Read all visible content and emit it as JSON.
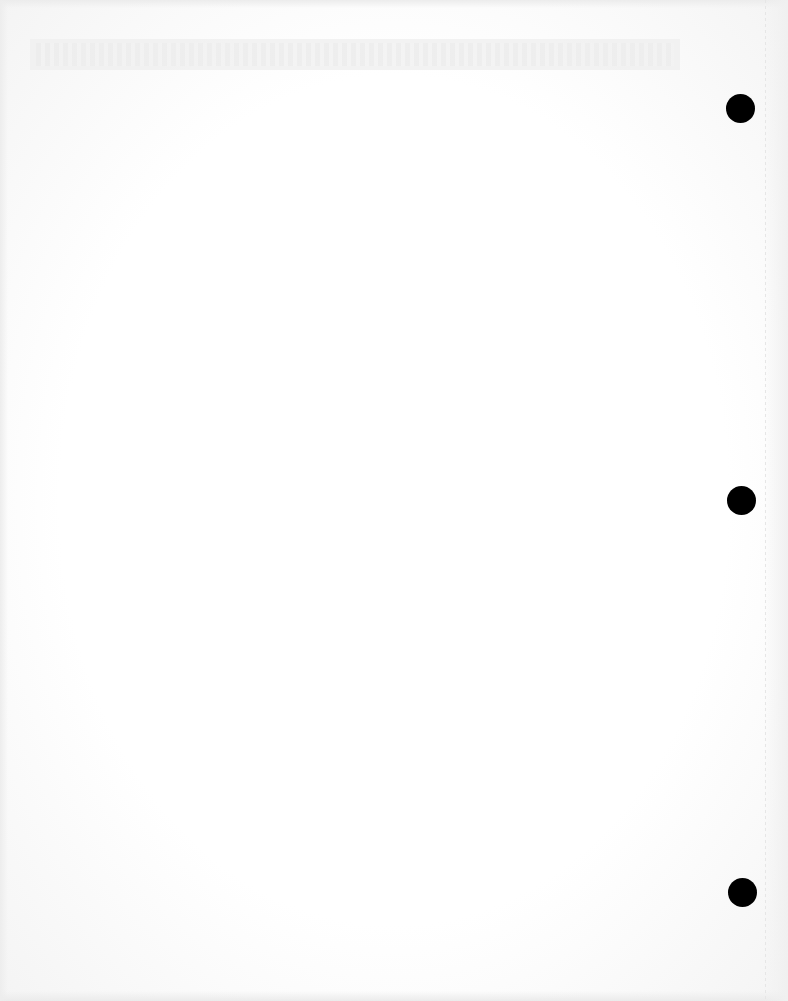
{
  "document": {
    "type": "blank scanned page",
    "header_band_text": "",
    "body_text": "",
    "punch_holes": [
      {
        "x": 740,
        "y": 108
      },
      {
        "x": 741,
        "y": 500
      },
      {
        "x": 742,
        "y": 892
      }
    ],
    "colors": {
      "paper": "#fdfdfd",
      "band": "#f1f1f1",
      "hole": "#000000"
    }
  }
}
